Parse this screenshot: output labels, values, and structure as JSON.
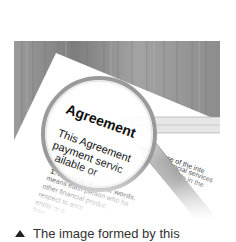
{
  "photo": {
    "subject": "magnifying-glass-over-agreement-document",
    "document": {
      "heading": "Agreement",
      "lines_magnified": [
        "This Agreement",
        "payment servic",
        "ailable or"
      ],
      "lines_right": [
        "ns your use of the inte",
        "r financial services",
        "ailable in the"
      ],
      "section_title": "1. Meaning of some words.",
      "section_tail": "In thi",
      "body_lines": [
        "means each person who ha",
        "other financial produc",
        "respect to anot",
        "entity or a",
        "how"
      ]
    },
    "colors": {
      "wood": "#8a8a8a",
      "paper": "#ffffff",
      "text": "#1a1a1a"
    }
  },
  "caption": {
    "icon": "triangle-up-icon",
    "text": "The image formed by this"
  }
}
